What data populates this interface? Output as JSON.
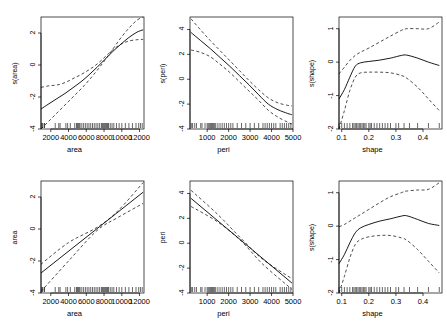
{
  "figure": {
    "kind": "gam-partial-effect-panel-grid",
    "rows": 2,
    "cols": 3,
    "background": "#ffffff",
    "line_color": "#000000",
    "frame_color": "#000000"
  },
  "chart_data": [
    {
      "id": "panel-top-left",
      "type": "line",
      "title": "",
      "xlabel": "area",
      "ylabel": "s(area)",
      "xlim": [
        900,
        12500
      ],
      "ylim": [
        -4,
        3
      ],
      "xticks": [
        2000,
        4000,
        6000,
        8000,
        10000,
        12000
      ],
      "xticklabels": [
        "2000",
        "4000",
        "6000",
        "8000",
        "10000",
        "12000"
      ],
      "yticks": [
        -4,
        -2,
        0,
        2
      ],
      "yticklabels": [
        "-4",
        "-2",
        "0",
        "2"
      ],
      "grid": false,
      "legend": "none",
      "rug": true,
      "series": [
        {
          "name": "fit",
          "style": "solid",
          "x": [
            900,
            1800,
            2700,
            3600,
            4500,
            5400,
            6300,
            7200,
            8100,
            9000,
            9900,
            10800,
            11700,
            12400
          ],
          "values": [
            -2.75,
            -2.42,
            -2.1,
            -1.78,
            -1.42,
            -1.05,
            -0.62,
            -0.15,
            0.35,
            0.85,
            1.3,
            1.72,
            2.05,
            2.2
          ]
        },
        {
          "name": "upper-se",
          "style": "dashed",
          "x": [
            900,
            1800,
            2700,
            3600,
            4500,
            5400,
            6300,
            7200,
            8100,
            9000,
            9900,
            10800,
            11700,
            12400
          ],
          "values": [
            -1.4,
            -1.3,
            -1.25,
            -1.1,
            -0.85,
            -0.6,
            -0.3,
            0.05,
            0.5,
            0.95,
            1.3,
            1.5,
            1.58,
            1.6
          ]
        },
        {
          "name": "lower-se",
          "style": "dashed",
          "x": [
            900,
            1800,
            2700,
            3600,
            4500,
            5400,
            6300,
            7200,
            8100,
            9000,
            9900,
            10800,
            11700,
            12400
          ],
          "values": [
            -4.0,
            -3.5,
            -3.0,
            -2.5,
            -2.0,
            -1.5,
            -0.95,
            -0.35,
            0.3,
            1.0,
            1.7,
            2.3,
            2.8,
            3.0
          ]
        }
      ],
      "rug_values": [
        1000,
        1050,
        1250,
        1300,
        2500,
        2900,
        3050,
        3700,
        3900,
        4200,
        4700,
        4900,
        5000,
        5100,
        5200,
        5300,
        5500,
        5700,
        5900,
        6100,
        6300,
        6500,
        6700,
        6900,
        7100,
        7300,
        7500,
        7700,
        7800,
        7900,
        8000,
        8100,
        8200,
        8300,
        8400,
        8500,
        8700,
        8900,
        9100,
        9400,
        9700,
        10000,
        10400,
        10800,
        11200,
        11600,
        11900,
        12100,
        12300
      ]
    },
    {
      "id": "panel-top-middle",
      "type": "line",
      "title": "",
      "xlabel": "peri",
      "ylabel": "s(peri)",
      "xlim": [
        200,
        5000
      ],
      "ylim": [
        -4,
        5
      ],
      "xticks": [
        1000,
        2000,
        3000,
        4000,
        5000
      ],
      "xticklabels": [
        "1000",
        "2000",
        "3000",
        "4000",
        "5000"
      ],
      "yticks": [
        -4,
        -2,
        0,
        2,
        4
      ],
      "yticklabels": [
        "-4",
        "-2",
        "0",
        "2",
        "4"
      ],
      "grid": false,
      "legend": "none",
      "rug": true,
      "series": [
        {
          "name": "fit",
          "style": "solid",
          "x": [
            250,
            700,
            1150,
            1600,
            2050,
            2500,
            2950,
            3400,
            3850,
            4300,
            4750,
            4950
          ],
          "values": [
            3.75,
            3.1,
            2.45,
            1.75,
            1.05,
            0.3,
            -0.45,
            -1.25,
            -2.0,
            -2.45,
            -2.75,
            -2.85
          ]
        },
        {
          "name": "upper-se",
          "style": "dashed",
          "x": [
            250,
            700,
            1150,
            1600,
            2050,
            2500,
            2950,
            3400,
            3850,
            4300,
            4750,
            4950
          ],
          "values": [
            4.85,
            3.95,
            3.1,
            2.3,
            1.5,
            0.7,
            -0.1,
            -0.85,
            -1.5,
            -1.9,
            -2.1,
            -2.15
          ]
        },
        {
          "name": "lower-se",
          "style": "dashed",
          "x": [
            250,
            700,
            1150,
            1600,
            2050,
            2500,
            2950,
            3400,
            3850,
            4300,
            4750,
            4950
          ],
          "values": [
            2.35,
            2.15,
            1.8,
            1.2,
            0.55,
            -0.2,
            -0.95,
            -1.7,
            -2.5,
            -3.05,
            -3.45,
            -3.6
          ]
        }
      ],
      "rug_values": [
        260,
        320,
        420,
        500,
        700,
        760,
        900,
        1000,
        1050,
        1100,
        1150,
        1200,
        1250,
        1300,
        1350,
        1400,
        1500,
        1600,
        1700,
        1800,
        1900,
        2000,
        2100,
        2200,
        2400,
        2600,
        2800,
        3000,
        3200,
        3400,
        3600,
        3700,
        3800,
        3900,
        4000,
        4100,
        4200,
        4400,
        4500,
        4600,
        4700,
        4800,
        4900
      ]
    },
    {
      "id": "panel-top-right",
      "type": "line",
      "title": "",
      "xlabel": "shape",
      "ylabel": "s(shape)",
      "xlim": [
        0.09,
        0.47
      ],
      "ylim": [
        -2,
        1.35
      ],
      "xticks": [
        0.1,
        0.2,
        0.3,
        0.4
      ],
      "xticklabels": [
        "0.1",
        "0.2",
        "0.3",
        "0.4"
      ],
      "yticks": [
        -2,
        -1,
        0,
        1
      ],
      "yticklabels": [
        "-2",
        "-1",
        "0",
        "1"
      ],
      "grid": false,
      "legend": "none",
      "rug": true,
      "series": [
        {
          "name": "fit",
          "style": "solid",
          "x": [
            0.09,
            0.11,
            0.13,
            0.15,
            0.17,
            0.2,
            0.24,
            0.28,
            0.32,
            0.34,
            0.38,
            0.42,
            0.46
          ],
          "values": [
            -1.1,
            -0.82,
            -0.45,
            -0.12,
            -0.02,
            0.02,
            0.06,
            0.12,
            0.2,
            0.21,
            0.12,
            0.0,
            -0.1
          ]
        },
        {
          "name": "upper-se",
          "style": "dashed",
          "x": [
            0.09,
            0.11,
            0.13,
            0.15,
            0.17,
            0.2,
            0.24,
            0.28,
            0.32,
            0.34,
            0.38,
            0.42,
            0.46
          ],
          "values": [
            -0.35,
            -0.15,
            0.05,
            0.2,
            0.3,
            0.42,
            0.6,
            0.78,
            0.95,
            1.0,
            1.0,
            1.0,
            1.2
          ]
        },
        {
          "name": "lower-se",
          "style": "dashed",
          "x": [
            0.09,
            0.11,
            0.13,
            0.15,
            0.17,
            0.2,
            0.24,
            0.28,
            0.32,
            0.34,
            0.38,
            0.42,
            0.46
          ],
          "values": [
            -2.0,
            -1.45,
            -0.85,
            -0.45,
            -0.32,
            -0.3,
            -0.3,
            -0.32,
            -0.4,
            -0.48,
            -0.75,
            -1.1,
            -1.45
          ]
        }
      ],
      "rug_values": [
        0.09,
        0.1,
        0.11,
        0.12,
        0.13,
        0.14,
        0.145,
        0.15,
        0.155,
        0.16,
        0.165,
        0.17,
        0.175,
        0.18,
        0.185,
        0.19,
        0.2,
        0.205,
        0.21,
        0.22,
        0.23,
        0.24,
        0.25,
        0.26,
        0.27,
        0.28,
        0.3,
        0.31,
        0.33,
        0.35,
        0.38,
        0.42,
        0.46
      ]
    },
    {
      "id": "panel-bottom-left",
      "type": "line",
      "title": "",
      "xlabel": "area",
      "ylabel": "area",
      "xlim": [
        900,
        12500
      ],
      "ylim": [
        -4,
        3
      ],
      "xticks": [
        2000,
        4000,
        6000,
        8000,
        10000,
        12000
      ],
      "xticklabels": [
        "2000",
        "4000",
        "6000",
        "8000",
        "10000",
        "12000"
      ],
      "yticks": [
        -4,
        -2,
        0,
        2
      ],
      "yticklabels": [
        "-4",
        "-2",
        "0",
        "2"
      ],
      "grid": false,
      "legend": "none",
      "rug": true,
      "series": [
        {
          "name": "fit",
          "style": "solid",
          "x": [
            900,
            12400
          ],
          "values": [
            -2.75,
            2.3
          ]
        },
        {
          "name": "upper-se",
          "style": "dashed",
          "x": [
            900,
            4000,
            7200,
            9500,
            12400
          ],
          "values": [
            -2.2,
            -0.85,
            0.1,
            1.1,
            2.9
          ]
        },
        {
          "name": "lower-se",
          "style": "dashed",
          "x": [
            900,
            4000,
            7200,
            9500,
            12400
          ],
          "values": [
            -3.9,
            -2.0,
            -0.1,
            0.7,
            1.6
          ]
        }
      ],
      "rug_values": [
        1000,
        1050,
        1250,
        1300,
        2500,
        2900,
        3050,
        3700,
        3900,
        4200,
        4700,
        4900,
        5000,
        5100,
        5200,
        5300,
        5500,
        5700,
        5900,
        6100,
        6300,
        6500,
        6700,
        6900,
        7100,
        7300,
        7500,
        7700,
        7800,
        7900,
        8000,
        8100,
        8200,
        8300,
        8400,
        8500,
        8700,
        8900,
        9100,
        9400,
        9700,
        10000,
        10400,
        10800,
        11200,
        11600,
        11900,
        12100,
        12300
      ]
    },
    {
      "id": "panel-bottom-middle",
      "type": "line",
      "title": "",
      "xlabel": "peri",
      "ylabel": "peri",
      "xlim": [
        200,
        5000
      ],
      "ylim": [
        -4,
        5
      ],
      "xticks": [
        1000,
        2000,
        3000,
        4000,
        5000
      ],
      "xticklabels": [
        "1000",
        "2000",
        "3000",
        "4000",
        "5000"
      ],
      "yticks": [
        -4,
        -2,
        0,
        2,
        4
      ],
      "yticklabels": [
        "-4",
        "-2",
        "0",
        "2",
        "4"
      ],
      "grid": false,
      "legend": "none",
      "rug": true,
      "series": [
        {
          "name": "fit",
          "style": "solid",
          "x": [
            250,
            4950
          ],
          "values": [
            3.6,
            -3.2
          ]
        },
        {
          "name": "upper-se",
          "style": "dashed",
          "x": [
            250,
            1500,
            2600,
            3600,
            4950
          ],
          "values": [
            4.25,
            2.3,
            0.35,
            -1.3,
            -2.85
          ]
        },
        {
          "name": "lower-se",
          "style": "dashed",
          "x": [
            250,
            1500,
            2600,
            3600,
            4950
          ],
          "values": [
            2.95,
            1.7,
            0.15,
            -1.7,
            -3.7
          ]
        }
      ],
      "rug_values": [
        260,
        320,
        420,
        500,
        700,
        760,
        900,
        1000,
        1050,
        1100,
        1150,
        1200,
        1250,
        1300,
        1350,
        1400,
        1500,
        1600,
        1700,
        1800,
        1900,
        2000,
        2100,
        2200,
        2400,
        2600,
        2800,
        3000,
        3200,
        3400,
        3600,
        3700,
        3800,
        3900,
        4000,
        4100,
        4200,
        4400,
        4500,
        4600,
        4700,
        4800,
        4900
      ]
    },
    {
      "id": "panel-bottom-right",
      "type": "line",
      "title": "",
      "xlabel": "shape",
      "ylabel": "s(shape)",
      "xlim": [
        0.09,
        0.47
      ],
      "ylim": [
        -2,
        1.35
      ],
      "xticks": [
        0.1,
        0.2,
        0.3,
        0.4
      ],
      "xticklabels": [
        "0.1",
        "0.2",
        "0.3",
        "0.4"
      ],
      "yticks": [
        -2,
        -1,
        0,
        1
      ],
      "yticklabels": [
        "-2",
        "-1",
        "0",
        "1"
      ],
      "grid": false,
      "legend": "none",
      "rug": true,
      "series": [
        {
          "name": "fit",
          "style": "solid",
          "x": [
            0.09,
            0.11,
            0.13,
            0.15,
            0.17,
            0.2,
            0.24,
            0.28,
            0.32,
            0.34,
            0.38,
            0.42,
            0.46
          ],
          "values": [
            -1.12,
            -0.85,
            -0.5,
            -0.2,
            -0.05,
            0.05,
            0.15,
            0.22,
            0.3,
            0.31,
            0.2,
            0.08,
            0.02
          ]
        },
        {
          "name": "upper-se",
          "style": "dashed",
          "x": [
            0.09,
            0.11,
            0.13,
            0.15,
            0.17,
            0.2,
            0.24,
            0.28,
            0.32,
            0.34,
            0.38,
            0.42,
            0.46
          ],
          "values": [
            -0.02,
            0.05,
            0.15,
            0.25,
            0.35,
            0.5,
            0.7,
            0.88,
            1.0,
            1.05,
            1.08,
            1.1,
            1.3
          ]
        },
        {
          "name": "lower-se",
          "style": "dashed",
          "x": [
            0.09,
            0.11,
            0.13,
            0.15,
            0.17,
            0.2,
            0.24,
            0.28,
            0.32,
            0.34,
            0.38,
            0.42,
            0.46
          ],
          "values": [
            -2.0,
            -1.5,
            -0.95,
            -0.55,
            -0.4,
            -0.32,
            -0.28,
            -0.28,
            -0.35,
            -0.42,
            -0.7,
            -1.05,
            -1.4
          ]
        }
      ],
      "rug_values": [
        0.09,
        0.1,
        0.11,
        0.12,
        0.13,
        0.14,
        0.145,
        0.15,
        0.155,
        0.16,
        0.165,
        0.17,
        0.175,
        0.18,
        0.185,
        0.19,
        0.2,
        0.205,
        0.21,
        0.22,
        0.23,
        0.24,
        0.25,
        0.26,
        0.27,
        0.28,
        0.3,
        0.31,
        0.33,
        0.35,
        0.38,
        0.42,
        0.46
      ]
    }
  ]
}
